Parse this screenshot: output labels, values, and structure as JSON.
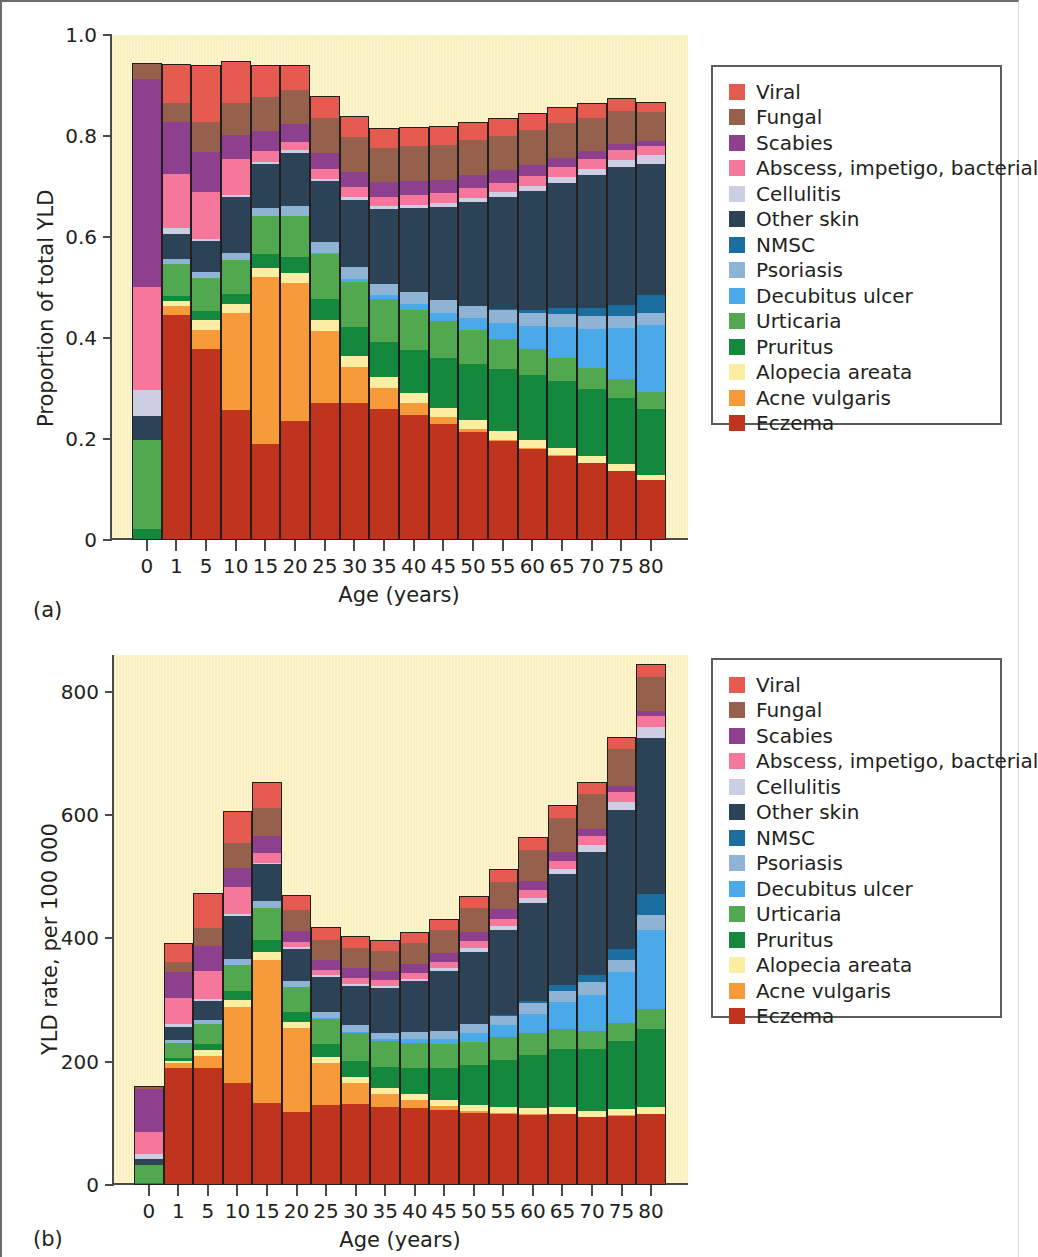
{
  "figure": {
    "panel_a_tag": "(a)",
    "panel_b_tag": "(b)"
  },
  "legend": {
    "items": [
      {
        "label": "Viral",
        "color": "#e65b50"
      },
      {
        "label": "Fungal",
        "color": "#96614c"
      },
      {
        "label": "Scabies",
        "color": "#8e3f8e"
      },
      {
        "label": "Abscess, impetigo, bacterial",
        "color": "#f5779b"
      },
      {
        "label": "Cellulitis",
        "color": "#cdcde4"
      },
      {
        "label": "Other skin",
        "color": "#2c4256"
      },
      {
        "label": "NMSC",
        "color": "#1a6fa0"
      },
      {
        "label": "Psoriasis",
        "color": "#8fb3d4"
      },
      {
        "label": "Decubitus ulcer",
        "color": "#4aa9e8"
      },
      {
        "label": "Urticaria",
        "color": "#51a84f"
      },
      {
        "label": "Pruritus",
        "color": "#14893d"
      },
      {
        "label": "Alopecia areata",
        "color": "#fbeda1"
      },
      {
        "label": "Acne vulgaris",
        "color": "#f79b3a"
      },
      {
        "label": "Eczema",
        "color": "#bf331f"
      }
    ]
  },
  "chart_data": [
    {
      "id": "panel-a",
      "type": "bar",
      "stacked": true,
      "title": "",
      "xlabel": "Age (years)",
      "ylabel": "Proportion of total YLD",
      "ylim": [
        0,
        1.0
      ],
      "yticks": [
        0,
        0.2,
        0.4,
        0.6,
        0.8,
        1.0
      ],
      "ytick_labels": [
        "0",
        "0.2",
        "0.4",
        "0.6",
        "0.8",
        "1.0"
      ],
      "grid": false,
      "legend_position": "right",
      "categories": [
        "0",
        "1",
        "5",
        "10",
        "15",
        "20",
        "25",
        "30",
        "35",
        "40",
        "45",
        "50",
        "55",
        "60",
        "65",
        "70",
        "75",
        "80"
      ],
      "series": [
        {
          "name": "Eczema",
          "color": "#bf331f",
          "values": [
            0.0,
            0.445,
            0.378,
            0.257,
            0.19,
            0.236,
            0.265,
            0.265,
            0.259,
            0.247,
            0.23,
            0.213,
            0.196,
            0.18,
            0.167,
            0.152,
            0.136,
            0.118
          ]
        },
        {
          "name": "Acne vulgaris",
          "color": "#f79b3a",
          "values": [
            0.0,
            0.019,
            0.037,
            0.192,
            0.33,
            0.272,
            0.14,
            0.07,
            0.043,
            0.025,
            0.013,
            0.006,
            0.003,
            0.002,
            0.001,
            0.001,
            0.001,
            0.0
          ]
        },
        {
          "name": "Alopecia areata",
          "color": "#fbeda1",
          "values": [
            0.0,
            0.01,
            0.02,
            0.018,
            0.019,
            0.021,
            0.02,
            0.02,
            0.02,
            0.019,
            0.018,
            0.018,
            0.017,
            0.016,
            0.015,
            0.014,
            0.013,
            0.011
          ]
        },
        {
          "name": "Pruritus",
          "color": "#14893d",
          "values": [
            0.022,
            0.01,
            0.019,
            0.021,
            0.028,
            0.031,
            0.042,
            0.056,
            0.07,
            0.085,
            0.1,
            0.112,
            0.122,
            0.128,
            0.131,
            0.132,
            0.132,
            0.13
          ]
        },
        {
          "name": "Urticaria",
          "color": "#51a84f",
          "values": [
            0.177,
            0.062,
            0.064,
            0.067,
            0.074,
            0.082,
            0.086,
            0.088,
            0.085,
            0.08,
            0.073,
            0.067,
            0.06,
            0.053,
            0.047,
            0.041,
            0.037,
            0.034
          ]
        },
        {
          "name": "Decubitus ulcer",
          "color": "#4aa9e8",
          "values": [
            0.0,
            0.0,
            0.0,
            0.0,
            0.0,
            0.0,
            0.003,
            0.006,
            0.008,
            0.011,
            0.016,
            0.023,
            0.032,
            0.045,
            0.06,
            0.078,
            0.1,
            0.132
          ]
        },
        {
          "name": "Psoriasis",
          "color": "#8fb3d4",
          "values": [
            0.0,
            0.01,
            0.012,
            0.014,
            0.017,
            0.019,
            0.021,
            0.022,
            0.023,
            0.024,
            0.025,
            0.025,
            0.026,
            0.026,
            0.026,
            0.026,
            0.025,
            0.024
          ]
        },
        {
          "name": "NMSC",
          "color": "#1a6fa0",
          "values": [
            0.0,
            0.0,
            0.0,
            0.0,
            0.0,
            0.0,
            0.0,
            0.0,
            0.0,
            0.0,
            0.0,
            0.0,
            0.001,
            0.006,
            0.012,
            0.016,
            0.022,
            0.036
          ]
        },
        {
          "name": "Other skin",
          "color": "#2c4256",
          "values": [
            0.047,
            0.05,
            0.062,
            0.11,
            0.086,
            0.106,
            0.117,
            0.13,
            0.147,
            0.166,
            0.185,
            0.205,
            0.222,
            0.235,
            0.248,
            0.262,
            0.272,
            0.26
          ]
        },
        {
          "name": "Cellulitis",
          "color": "#cdcde4",
          "values": [
            0.051,
            0.012,
            0.005,
            0.005,
            0.004,
            0.005,
            0.005,
            0.006,
            0.006,
            0.007,
            0.008,
            0.009,
            0.01,
            0.011,
            0.012,
            0.013,
            0.015,
            0.017
          ]
        },
        {
          "name": "Abscess, impetigo, bacterial",
          "color": "#f5779b",
          "values": [
            0.204,
            0.106,
            0.092,
            0.07,
            0.022,
            0.017,
            0.019,
            0.019,
            0.019,
            0.019,
            0.019,
            0.019,
            0.019,
            0.019,
            0.019,
            0.019,
            0.019,
            0.019
          ]
        },
        {
          "name": "Scabies",
          "color": "#8e3f8e",
          "values": [
            0.411,
            0.104,
            0.079,
            0.049,
            0.04,
            0.034,
            0.031,
            0.03,
            0.029,
            0.028,
            0.027,
            0.026,
            0.024,
            0.022,
            0.019,
            0.016,
            0.013,
            0.009
          ]
        },
        {
          "name": "Fungal",
          "color": "#96614c",
          "values": [
            0.033,
            0.037,
            0.06,
            0.062,
            0.068,
            0.068,
            0.068,
            0.068,
            0.068,
            0.069,
            0.069,
            0.069,
            0.069,
            0.069,
            0.068,
            0.066,
            0.064,
            0.057
          ]
        },
        {
          "name": "Viral",
          "color": "#e65b50",
          "values": [
            0.0,
            0.078,
            0.113,
            0.083,
            0.063,
            0.049,
            0.042,
            0.039,
            0.038,
            0.037,
            0.036,
            0.035,
            0.034,
            0.033,
            0.032,
            0.03,
            0.027,
            0.021
          ]
        }
      ],
      "stack_totals": [
        0.945,
        0.943,
        0.941,
        0.948,
        0.941,
        0.94,
        0.879,
        0.839,
        0.815,
        0.817,
        0.819,
        0.827,
        0.835,
        0.845,
        0.857,
        0.866,
        0.876,
        0.868
      ]
    },
    {
      "id": "panel-b",
      "type": "bar",
      "stacked": true,
      "title": "",
      "xlabel": "Age (years)",
      "ylabel": "YLD rate, per 100 000",
      "ylim": [
        0,
        860
      ],
      "yticks": [
        0,
        200,
        400,
        600,
        800
      ],
      "ytick_labels": [
        "0",
        "200",
        "400",
        "600",
        "800"
      ],
      "grid": false,
      "legend_position": "right",
      "categories": [
        "0",
        "1",
        "5",
        "10",
        "15",
        "20",
        "25",
        "30",
        "35",
        "40",
        "45",
        "50",
        "55",
        "60",
        "65",
        "70",
        "75",
        "80"
      ],
      "series": [
        {
          "name": "Eczema",
          "color": "#bf331f",
          "values": [
            0,
            185,
            193,
            167,
            133,
            124,
            114,
            110,
            107,
            105,
            105,
            105,
            105,
            105,
            105,
            105,
            105,
            103
          ]
        },
        {
          "name": "Acne vulgaris",
          "color": "#f79b3a",
          "values": [
            0,
            8,
            19,
            125,
            232,
            144,
            60,
            29,
            18,
            11,
            6,
            3,
            2,
            1,
            1,
            1,
            1,
            0
          ]
        },
        {
          "name": "Alopecia areata",
          "color": "#fbeda1",
          "values": [
            0,
            4,
            10,
            12,
            13,
            11,
            9,
            8,
            8,
            8,
            8,
            9,
            9,
            9,
            9,
            9,
            10,
            10
          ]
        },
        {
          "name": "Pruritus",
          "color": "#14893d",
          "values": [
            3,
            4,
            10,
            14,
            20,
            16,
            18,
            23,
            29,
            36,
            46,
            58,
            69,
            79,
            86,
            95,
            102,
            113
          ]
        },
        {
          "name": "Urticaria",
          "color": "#51a84f",
          "values": [
            28,
            25,
            33,
            44,
            52,
            43,
            36,
            37,
            35,
            34,
            33,
            34,
            34,
            33,
            31,
            29,
            28,
            29
          ]
        },
        {
          "name": "Decubitus ulcer",
          "color": "#4aa9e8",
          "values": [
            0,
            0,
            0,
            0,
            0,
            0,
            1,
            2,
            3,
            5,
            7,
            12,
            18,
            28,
            39,
            56,
            77,
            115
          ]
        },
        {
          "name": "Psoriasis",
          "color": "#8fb3d4",
          "values": [
            0,
            4,
            6,
            9,
            11,
            10,
            9,
            9,
            9,
            10,
            11,
            13,
            14,
            16,
            17,
            19,
            19,
            21
          ]
        },
        {
          "name": "NMSC",
          "color": "#1a6fa0",
          "values": [
            0,
            0,
            0,
            0,
            0,
            0,
            0,
            0,
            0,
            0,
            0,
            0,
            1,
            4,
            8,
            12,
            17,
            31
          ]
        },
        {
          "name": "Other skin",
          "color": "#2c4256",
          "values": [
            8,
            20,
            32,
            71,
            60,
            56,
            50,
            54,
            61,
            70,
            85,
            106,
            126,
            146,
            165,
            190,
            210,
            226
          ]
        },
        {
          "name": "Cellulitis",
          "color": "#cdcde4",
          "values": [
            8,
            5,
            3,
            3,
            3,
            3,
            2,
            3,
            3,
            3,
            4,
            5,
            6,
            7,
            8,
            10,
            12,
            15
          ]
        },
        {
          "name": "Abscess, impetigo, bacterial",
          "color": "#f5779b",
          "values": [
            33,
            42,
            47,
            45,
            15,
            9,
            8,
            8,
            8,
            8,
            9,
            10,
            11,
            12,
            12,
            14,
            15,
            16
          ]
        },
        {
          "name": "Scabies",
          "color": "#8e3f8e",
          "values": [
            66,
            41,
            40,
            31,
            28,
            18,
            13,
            13,
            12,
            12,
            12,
            13,
            14,
            14,
            13,
            12,
            10,
            8
          ]
        },
        {
          "name": "Fungal",
          "color": "#96614c",
          "values": [
            5,
            15,
            31,
            40,
            46,
            36,
            29,
            28,
            28,
            29,
            32,
            36,
            41,
            46,
            50,
            53,
            56,
            49
          ]
        },
        {
          "name": "Viral",
          "color": "#e65b50",
          "values": [
            0,
            31,
            57,
            53,
            42,
            25,
            18,
            16,
            15,
            15,
            16,
            17,
            18,
            19,
            19,
            19,
            18,
            18
          ]
        }
      ],
      "stack_totals": [
        161,
        393,
        474,
        607,
        654,
        470,
        418,
        404,
        398,
        411,
        432,
        469,
        512,
        565,
        616,
        654,
        727,
        845
      ]
    }
  ]
}
